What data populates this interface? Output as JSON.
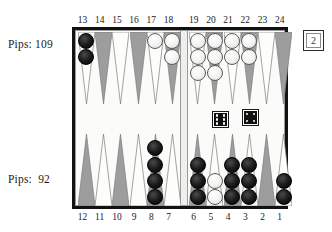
{
  "board": {
    "title": "backgammon-board",
    "top_player_pips_label": "Pips: 109",
    "bottom_player_pips_label": "Pips:  92",
    "top_point_numbers": [
      "13",
      "14",
      "15",
      "16",
      "17",
      "18",
      "19",
      "20",
      "21",
      "22",
      "23",
      "24"
    ],
    "bottom_point_numbers": [
      "12",
      "11",
      "10",
      "9",
      "8",
      "7",
      "6",
      "5",
      "4",
      "3",
      "2",
      "1"
    ],
    "doubling_cube_value": "2",
    "colors": {
      "frame": "#121212",
      "point_dark": "#9d9d9d",
      "point_light": "#fbfbfa",
      "checker_black": "#000000",
      "checker_white": "#ffffff",
      "background": "#ffffff"
    }
  },
  "dice": [
    {
      "name": "die-left",
      "value": 6
    },
    {
      "name": "die-right",
      "value": 4
    }
  ],
  "points": [
    {
      "number": "13",
      "color": "black",
      "count": 2
    },
    {
      "number": "14",
      "color": "none",
      "count": 0
    },
    {
      "number": "15",
      "color": "none",
      "count": 0
    },
    {
      "number": "16",
      "color": "none",
      "count": 0
    },
    {
      "number": "17",
      "color": "white",
      "count": 1
    },
    {
      "number": "18",
      "color": "white",
      "count": 2
    },
    {
      "number": "19",
      "color": "white",
      "count": 3
    },
    {
      "number": "20",
      "color": "white",
      "count": 3
    },
    {
      "number": "21",
      "color": "white",
      "count": 2
    },
    {
      "number": "22",
      "color": "white",
      "count": 2
    },
    {
      "number": "23",
      "color": "none",
      "count": 0
    },
    {
      "number": "24",
      "color": "none",
      "count": 0
    },
    {
      "number": "12",
      "color": "none",
      "count": 0
    },
    {
      "number": "11",
      "color": "none",
      "count": 0
    },
    {
      "number": "10",
      "color": "none",
      "count": 0
    },
    {
      "number": "9",
      "color": "none",
      "count": 0
    },
    {
      "number": "8",
      "color": "black",
      "count": 4
    },
    {
      "number": "7",
      "color": "none",
      "count": 0
    },
    {
      "number": "6",
      "color": "black",
      "count": 3
    },
    {
      "number": "5",
      "color": "white",
      "count": 2
    },
    {
      "number": "4",
      "color": "black",
      "count": 3
    },
    {
      "number": "3",
      "color": "black",
      "count": 3
    },
    {
      "number": "2",
      "color": "none",
      "count": 0
    },
    {
      "number": "1",
      "color": "black",
      "count": 2
    }
  ]
}
